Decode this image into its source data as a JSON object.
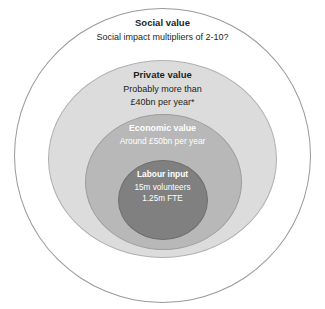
{
  "chart_data": {
    "type": "diagram",
    "diagram_style": "concentric-circles",
    "title": "",
    "layers": [
      {
        "id": "social",
        "heading": "Social value",
        "lines": [
          "Social impact multipliers of 2-10?"
        ],
        "fill": "#ffffff",
        "stroke": "#9a9a9a",
        "text_color": "#231f20",
        "level": 1
      },
      {
        "id": "private",
        "heading": "Private value",
        "lines": [
          "Probably more than",
          "£40bn per year*"
        ],
        "fill": "#dcdcdc",
        "stroke": "#b0b0b0",
        "text_color": "#231f20",
        "level": 2
      },
      {
        "id": "economic",
        "heading": "Economic value",
        "lines": [
          "Around £50bn per year"
        ],
        "fill": "#b8b8b8",
        "stroke": "#9d9d9d",
        "text_color": "#ffffff",
        "level": 3
      },
      {
        "id": "labour",
        "heading": "Labour input",
        "lines": [
          "15m volunteers",
          "1.25m FTE"
        ],
        "fill": "#808080",
        "stroke": "#6e6e6e",
        "text_color": "#ffffff",
        "level": 4
      }
    ]
  },
  "layers": {
    "social": {
      "heading": "Social value",
      "line1": "Social impact multipliers of 2-10?"
    },
    "private": {
      "heading": "Private value",
      "line1": "Probably more than",
      "line2": "£40bn per year*"
    },
    "economic": {
      "heading": "Economic value",
      "line1": "Around £50bn per year"
    },
    "labour": {
      "heading": "Labour input",
      "line1": "15m volunteers",
      "line2": "1.25m FTE"
    }
  },
  "colors": {
    "background": "#ffffff",
    "social_fill": "#ffffff",
    "private_fill": "#dcdcdc",
    "economic_fill": "#b8b8b8",
    "labour_fill": "#808080",
    "dark_text": "#231f20",
    "light_text": "#ffffff"
  }
}
